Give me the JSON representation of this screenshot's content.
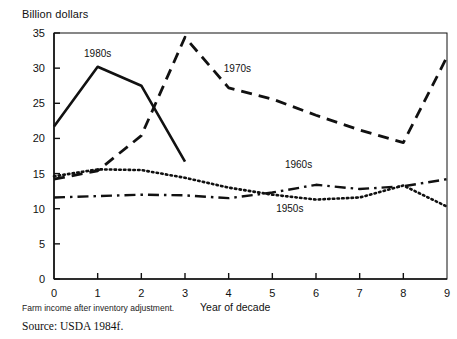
{
  "figure": {
    "y_axis_title": "Billion dollars",
    "x_axis_title": "Year of decade",
    "footnote": "Farm income after inventory adjustment.",
    "source": "Source: USDA 1984f.",
    "ink_color": "#111111",
    "background_color": "#ffffff"
  },
  "chart_data": {
    "type": "line",
    "title": "",
    "subtitle": "",
    "xlabel": "Year of decade",
    "ylabel": "Billion dollars",
    "xlim": [
      0,
      9
    ],
    "ylim": [
      0,
      35
    ],
    "xticks": [
      0,
      1,
      2,
      3,
      4,
      5,
      6,
      7,
      8,
      9
    ],
    "xtick_labels": [
      "0",
      "1",
      "2",
      "3",
      "4",
      "5",
      "6",
      "7",
      "8",
      "9"
    ],
    "yticks": [
      0,
      5,
      10,
      15,
      20,
      25,
      30,
      35
    ],
    "ytick_labels": [
      "0",
      "5",
      "10",
      "15",
      "20",
      "25",
      "30",
      "35"
    ],
    "grid": false,
    "legend_position": "inline-annotations",
    "x": [
      0,
      1,
      2,
      3,
      4,
      5,
      6,
      7,
      8,
      9
    ],
    "series": [
      {
        "name": "1980s",
        "style": "solid",
        "label": "1980s",
        "label_x": 1.0,
        "label_y": 31.6,
        "values": [
          21.7,
          30.2,
          27.5,
          16.7,
          null,
          null,
          null,
          null,
          null,
          null
        ]
      },
      {
        "name": "1970s",
        "style": "dashed",
        "label": "1970s",
        "label_x": 4.2,
        "label_y": 29.4,
        "values": [
          14.2,
          15.4,
          20.4,
          34.4,
          27.2,
          25.6,
          23.3,
          21.2,
          19.4,
          31.6
        ]
      },
      {
        "name": "1960s",
        "style": "dash-dot",
        "label": "1960s",
        "label_x": 5.6,
        "label_y": 15.8,
        "values": [
          11.6,
          11.8,
          12.0,
          11.9,
          11.5,
          12.3,
          13.4,
          12.8,
          13.2,
          14.2
        ]
      },
      {
        "name": "1950s",
        "style": "dotted",
        "label": "1950s",
        "label_x": 5.4,
        "label_y": 9.5,
        "values": [
          14.6,
          15.6,
          15.5,
          14.4,
          13.0,
          12.0,
          11.3,
          11.6,
          13.3,
          10.3
        ]
      }
    ]
  }
}
